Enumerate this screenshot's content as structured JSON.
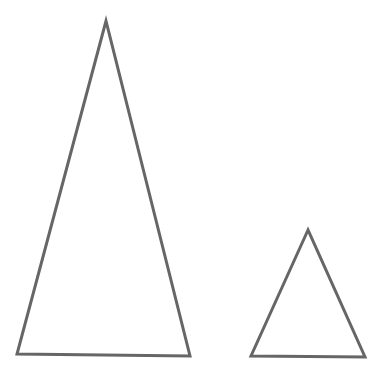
{
  "figure": {
    "width": 384,
    "height": 380,
    "background": "#ffffff",
    "stroke_color": "#666666",
    "stroke_width": 3
  },
  "shapes": [
    {
      "name": "large-triangle",
      "type": "triangle",
      "points": [
        [
          106,
          21
        ],
        [
          17,
          354
        ],
        [
          190,
          356
        ]
      ]
    },
    {
      "name": "small-triangle",
      "type": "triangle",
      "points": [
        [
          308,
          230
        ],
        [
          251,
          356
        ],
        [
          365,
          357
        ]
      ]
    }
  ]
}
